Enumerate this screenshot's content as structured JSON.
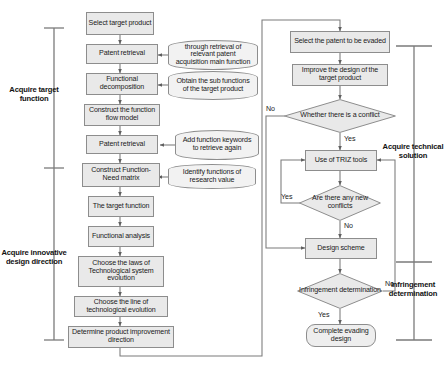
{
  "diagram": {
    "colors": {
      "process_fill": "#e9e9e9",
      "cylinder_fill": "#f2f2f2",
      "terminator_fill": "#eeeeee",
      "stroke": "#8d8d8d",
      "wire": "#7a7a7a",
      "text": "#1b1b1b"
    },
    "left_column": {
      "nodes": [
        {
          "id": "select_target_product",
          "label": "Select target product",
          "shape": "process"
        },
        {
          "id": "patent_retrieval_1",
          "label": "Patent retrieval",
          "shape": "process"
        },
        {
          "id": "functional_decomposition",
          "label": "Functional decomposition",
          "shape": "process"
        },
        {
          "id": "construct_function_flow_model",
          "label": "Construct the function flow model",
          "shape": "process"
        },
        {
          "id": "patent_retrieval_2",
          "label": "Patent retrieval",
          "shape": "process"
        },
        {
          "id": "construct_function_need_matrix",
          "label": "Construct Function-Need matrix",
          "shape": "process"
        },
        {
          "id": "the_target_function",
          "label": "The target function",
          "shape": "process"
        },
        {
          "id": "functional_analysis",
          "label": "Functional analysis",
          "shape": "process"
        },
        {
          "id": "choose_laws",
          "label": "Choose the laws of Technological system evolution",
          "shape": "process"
        },
        {
          "id": "choose_line",
          "label": "Choose the line of technological evolution",
          "shape": "process"
        },
        {
          "id": "determine_improvement",
          "label": "Determine product improvement direction",
          "shape": "process"
        }
      ],
      "annotations": [
        {
          "id": "ann_patent_main_function",
          "label": "through retrieval of relevant patent acquisition main function",
          "shape": "cylinder"
        },
        {
          "id": "ann_sub_functions",
          "label": "Obtain the sub functions of the target product",
          "shape": "cylinder"
        },
        {
          "id": "ann_add_keywords",
          "label": "Add function keywords to retrieve again",
          "shape": "cylinder"
        },
        {
          "id": "ann_identify_functions",
          "label": "Identify functions of research value",
          "shape": "cylinder"
        }
      ]
    },
    "right_column": {
      "nodes": [
        {
          "id": "select_patent_evaded",
          "label": "Select the patent to be evaded",
          "shape": "process"
        },
        {
          "id": "improve_design",
          "label": "Improve the design of the target product",
          "shape": "process"
        },
        {
          "id": "whether_conflict",
          "label": "Whether there is a conflict",
          "shape": "decision"
        },
        {
          "id": "use_triz_tools",
          "label": "Use of TRIZ tools",
          "shape": "process"
        },
        {
          "id": "any_new_conflicts",
          "label": "Are there any new conflicts",
          "shape": "decision"
        },
        {
          "id": "design_scheme",
          "label": "Design scheme",
          "shape": "process"
        },
        {
          "id": "infringement_determination",
          "label": "Infringement determination",
          "shape": "decision"
        },
        {
          "id": "complete_evading_design",
          "label": "Complete evading design",
          "shape": "terminator"
        }
      ]
    },
    "edge_labels": {
      "conflict_no": "No",
      "conflict_yes": "Yes",
      "new_conflicts_yes": "Yes",
      "new_conflicts_no": "No",
      "infringement_no": "No",
      "infringement_yes": "Yes"
    },
    "phase_brackets": [
      {
        "id": "acquire_target_function",
        "label": "Acquire target function",
        "side": "left"
      },
      {
        "id": "acquire_innovative_design_direction",
        "label": "Acquire innovative design direction",
        "side": "left"
      },
      {
        "id": "acquire_technical_solution",
        "label": "Acquire technical solution",
        "side": "right"
      },
      {
        "id": "infringement_determination_phase",
        "label": "Infringement determination",
        "side": "right"
      }
    ]
  }
}
